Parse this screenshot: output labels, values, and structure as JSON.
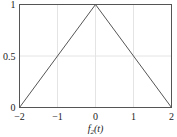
{
  "chart_data": {
    "type": "line",
    "title": "",
    "xlabel": "f2(t)",
    "xlabel_parts": {
      "base": "f",
      "sub": "2",
      "arg": "(t)"
    },
    "ylabel": "",
    "xlim": [
      -2,
      2
    ],
    "ylim": [
      0,
      1
    ],
    "grid": true,
    "legend": null,
    "x_ticks": [
      -2,
      -1,
      0,
      1,
      2
    ],
    "x_tick_labels": [
      "−2",
      "−1",
      "0",
      "1",
      "2"
    ],
    "y_ticks": [
      0,
      0.5,
      1
    ],
    "y_tick_labels": [
      "0",
      "0.5",
      "1"
    ],
    "series": [
      {
        "name": "f2(t)",
        "x": [
          -2,
          0,
          2
        ],
        "y": [
          0,
          1,
          0
        ],
        "color": "#555555"
      }
    ]
  },
  "colors": {
    "axes": "#555555",
    "grid": "#e4e4e4",
    "line": "#555555"
  }
}
